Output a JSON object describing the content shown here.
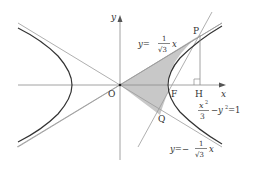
{
  "figure": {
    "axes": {
      "x_label": "x",
      "y_label": "y",
      "origin_label": "O"
    },
    "points": {
      "P": "P",
      "Q": "Q",
      "F": "F",
      "H": "H"
    },
    "equations": {
      "upper_asymptote": {
        "lhs": "y=",
        "num": "1",
        "den": "√3",
        "var": "x"
      },
      "lower_asymptote": {
        "lhs": "y=−",
        "num": "1",
        "den": "√3",
        "var": "x"
      },
      "hyperbola": {
        "x2": "x",
        "sup2": "2",
        "den": "3",
        "rest": "−y",
        "rest_sup": "2",
        "eq": "=1"
      }
    },
    "colors": {
      "curve": "#333333",
      "line": "#9a9a9a",
      "shade": "#c8c8c8",
      "text": "#333333"
    }
  }
}
